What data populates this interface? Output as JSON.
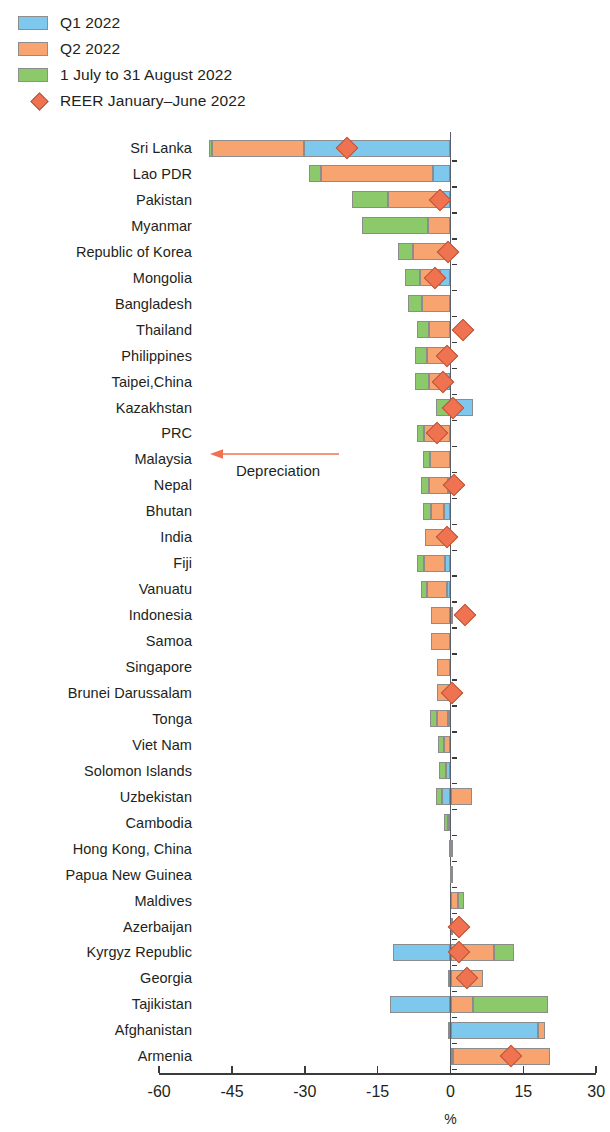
{
  "legend": {
    "items": [
      {
        "label": "Q1 2022",
        "marker": "square-swatch",
        "color": "#7ec8ee"
      },
      {
        "label": "Q2 2022",
        "marker": "square-swatch",
        "color": "#f8a470"
      },
      {
        "label": "1 July to 31 August 2022",
        "marker": "square-swatch",
        "color": "#8cc96b"
      },
      {
        "label": "REER January–June 2022",
        "marker": "diamond-marker",
        "color": "#ef7351"
      }
    ]
  },
  "annotation": {
    "depreciation_label": "Depreciation",
    "arrow_direction": "left"
  },
  "axis": {
    "title": "%",
    "ticks": [
      "-60",
      "-45",
      "-30",
      "-15",
      "0",
      "15",
      "30"
    ],
    "tick_values": [
      -60,
      -45,
      -30,
      -15,
      0,
      15,
      30
    ]
  },
  "chart_data": {
    "type": "bar",
    "orientation": "horizontal",
    "stacked": true,
    "title": "",
    "xlabel": "%",
    "ylabel": "",
    "xlim": [
      -60,
      30
    ],
    "grid": false,
    "legend_position": "top-left",
    "series_names": [
      "Q1 2022",
      "Q2 2022",
      "1 July to 31 August 2022"
    ],
    "series_colors": [
      "#7ec8ee",
      "#f8a470",
      "#8cc96b"
    ],
    "marker_name": "REER January–June 2022",
    "marker_color": "#ef7351",
    "categories": [
      "Sri Lanka",
      "Lao PDR",
      "Pakistan",
      "Myanmar",
      "Republic of Korea",
      "Mongolia",
      "Bangladesh",
      "Thailand",
      "Philippines",
      "Taipei,China",
      "Kazakhstan",
      "PRC",
      "Malaysia",
      "Nepal",
      "Bhutan",
      "India",
      "Fiji",
      "Vanuatu",
      "Indonesia",
      "Samoa",
      "Singapore",
      "Brunei Darussalam",
      "Tonga",
      "Viet Nam",
      "Solomon Islands",
      "Uzbekistan",
      "Cambodia",
      "Hong Kong, China",
      "Papua New Guinea",
      "Maldives",
      "Azerbaijan",
      "Kyrgyz Republic",
      "Georgia",
      "Tajikistan",
      "Afghanistan",
      "Armenia"
    ],
    "series": [
      {
        "name": "Q1 2022",
        "values": [
          -30.2,
          -3.7,
          -2.7,
          0.0,
          -0.6,
          -2.1,
          0.0,
          0.0,
          -0.5,
          -1.2,
          4.7,
          0.0,
          0.0,
          -0.6,
          -1.4,
          -0.6,
          -1.2,
          -0.8,
          0.0,
          0.0,
          0.0,
          0.0,
          -0.6,
          0.0,
          -1.0,
          -1.8,
          -0.6,
          -0.4,
          -0.2,
          0.0,
          0.0,
          -11.9,
          0.0,
          -12.5,
          18.1,
          0.6
        ]
      },
      {
        "name": "Q2 2022",
        "values": [
          -18.9,
          -23.0,
          -10.1,
          -4.7,
          -7.2,
          -4.1,
          -5.8,
          -4.5,
          -4.3,
          -3.3,
          0.0,
          -5.5,
          -4.3,
          -3.9,
          -2.7,
          -4.7,
          -4.3,
          -4.1,
          -4.1,
          -4.1,
          -2.7,
          -2.7,
          -2.1,
          -1.4,
          0.0,
          4.5,
          0.0,
          0.0,
          0.0,
          1.6,
          0.2,
          9.0,
          6.6,
          4.7,
          1.4,
          19.9
        ]
      },
      {
        "name": "1 July to 31 August 2022",
        "values": [
          -0.6,
          -2.5,
          -7.4,
          -13.6,
          -3.1,
          -3.1,
          -2.9,
          -2.3,
          -2.5,
          -2.9,
          -2.9,
          -1.4,
          -1.4,
          -1.6,
          -1.6,
          0.0,
          -1.4,
          -1.2,
          0.6,
          0.0,
          0.0,
          0.0,
          -1.6,
          -1.2,
          -1.4,
          -1.2,
          -0.8,
          0.4,
          0.2,
          1.2,
          0.0,
          4.1,
          -0.6,
          15.4,
          -0.6,
          0.0
        ]
      }
    ],
    "reer_markers": [
      {
        "category": "Sri Lanka",
        "value": -21.4
      },
      {
        "category": "Pakistan",
        "value": -2.1
      },
      {
        "category": "Republic of Korea",
        "value": -0.6
      },
      {
        "category": "Mongolia",
        "value": -3.1
      },
      {
        "category": "Thailand",
        "value": 2.5
      },
      {
        "category": "Philippines",
        "value": -0.8
      },
      {
        "category": "Taipei,China",
        "value": -1.6
      },
      {
        "category": "Kazakhstan",
        "value": 0.6
      },
      {
        "category": "PRC",
        "value": -2.7
      },
      {
        "category": "Nepal",
        "value": 0.8
      },
      {
        "category": "India",
        "value": -0.8
      },
      {
        "category": "Indonesia",
        "value": 2.9
      },
      {
        "category": "Brunei Darussalam",
        "value": 0.4
      },
      {
        "category": "Azerbaijan",
        "value": 1.8
      },
      {
        "category": "Kyrgyz Republic",
        "value": 1.8
      },
      {
        "category": "Georgia",
        "value": 3.3
      },
      {
        "category": "Armenia",
        "value": 12.5
      }
    ]
  }
}
